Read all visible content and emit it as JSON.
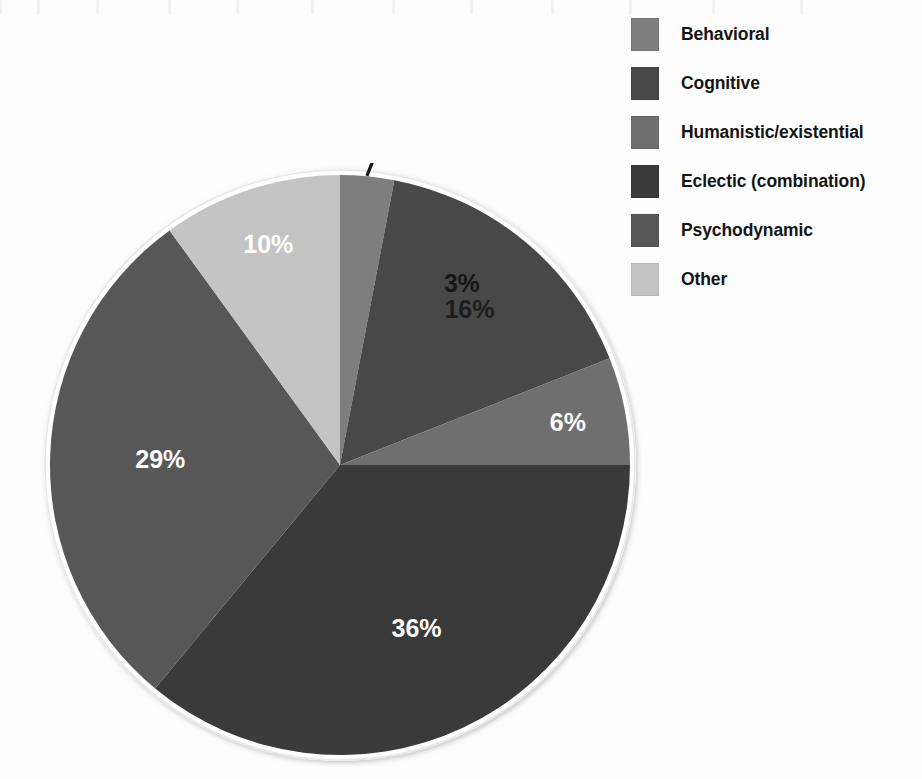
{
  "chart_data": {
    "type": "pie",
    "title": "",
    "subtitle": "",
    "xlabel": "",
    "ylabel": "",
    "grid": false,
    "legend_position": "right",
    "start_angle_deg": 0,
    "direction": "clockwise",
    "categories": [
      "Behavioral",
      "Cognitive",
      "Humanistic/existential",
      "Eclectic (combination)",
      "Psychodynamic",
      "Other"
    ],
    "values": [
      3,
      16,
      6,
      36,
      29,
      10
    ],
    "value_unit": "%",
    "data_labels": [
      "3%",
      "16%",
      "6%",
      "36%",
      "29%",
      "10%"
    ],
    "data_label_colors": [
      "dark",
      "dark",
      "light",
      "light",
      "light",
      "light"
    ],
    "slice_colors": [
      "#7e7e7e",
      "#484848",
      "#6f6f6f",
      "#3a3a3a",
      "#575757",
      "#c4c4c4"
    ],
    "annotations": [
      {
        "text": "3%",
        "target_category": "Behavioral",
        "style": "leader-line"
      }
    ]
  },
  "pie": {
    "ring_color": "#ffffff",
    "ring_shadow_color": "#d8d8d8",
    "callout": {
      "label": "3%"
    },
    "slices": [
      {
        "key": "behavioral",
        "label": "Behavioral",
        "percent": 3,
        "display": "3%",
        "color": "#7e7e7e",
        "label_color": "dark",
        "show_inside_label": false
      },
      {
        "key": "cognitive",
        "label": "Cognitive",
        "percent": 16,
        "display": "16%",
        "color": "#484848",
        "label_color": "dark",
        "show_inside_label": true
      },
      {
        "key": "humanistic",
        "label": "Humanistic/existential",
        "percent": 6,
        "display": "6%",
        "color": "#6f6f6f",
        "label_color": "light",
        "show_inside_label": true
      },
      {
        "key": "eclectic",
        "label": "Eclectic (combination)",
        "percent": 36,
        "display": "36%",
        "color": "#3a3a3a",
        "label_color": "light",
        "show_inside_label": true
      },
      {
        "key": "psychodynamic",
        "label": "Psychodynamic",
        "percent": 29,
        "display": "29%",
        "color": "#575757",
        "label_color": "light",
        "show_inside_label": true
      },
      {
        "key": "other",
        "label": "Other",
        "percent": 10,
        "display": "10%",
        "color": "#c4c4c4",
        "label_color": "light",
        "show_inside_label": true
      }
    ]
  },
  "legend": {
    "items": [
      {
        "label": "Behavioral",
        "color": "#7e7e7e"
      },
      {
        "label": "Cognitive",
        "color": "#484848"
      },
      {
        "label": "Humanistic/existential",
        "color": "#6f6f6f"
      },
      {
        "label": "Eclectic (combination)",
        "color": "#3a3a3a"
      },
      {
        "label": "Psychodynamic",
        "color": "#575757"
      },
      {
        "label": "Other",
        "color": "#c4c4c4"
      }
    ]
  }
}
